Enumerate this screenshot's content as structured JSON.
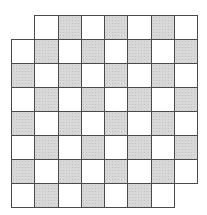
{
  "diagram": {
    "type": "checkerboard-grid",
    "rows": 8,
    "cols": 8,
    "origin": {
      "x": 11,
      "y": 15
    },
    "cell_width": 23.25,
    "cell_height": 24,
    "line_color": "#4a4a4a",
    "shaded_color": "#d8d8d8",
    "empty_color": "#ffffff",
    "missing_cells": [
      {
        "row": 0,
        "col": 0
      },
      {
        "row": 7,
        "col": 7
      }
    ],
    "shading_rule": "(row + col) even is shaded"
  }
}
